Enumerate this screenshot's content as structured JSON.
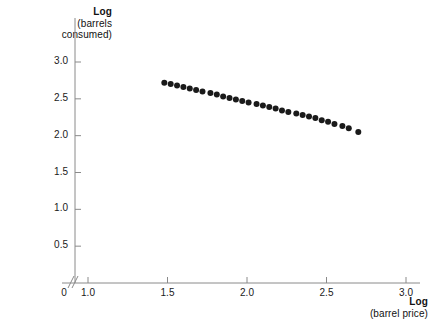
{
  "figure": {
    "background": "#ffffff",
    "ink_color": "#1a1a1a",
    "point_color": "#1a1a1a",
    "axis_color": "#8a8a8a"
  },
  "axes": {
    "y_title_main": "Log",
    "y_title_sub": "(barrels consumed)",
    "y_title_line1": "Log",
    "y_title_line2": "(barrels",
    "y_title_line3": "consumed)",
    "x_title_main": "Log",
    "x_title_sub": "(barrel price)",
    "origin_label": "0",
    "break_symbol": "//"
  },
  "chart_data": {
    "type": "scatter",
    "title": "",
    "xlabel": "Log (barrel price)",
    "ylabel": "Log (barrels consumed)",
    "xlim": [
      1.0,
      3.0
    ],
    "ylim": [
      0.0,
      3.0
    ],
    "xticks": [
      1.0,
      1.5,
      2.0,
      2.5,
      3.0
    ],
    "xtick_labels": [
      "1.0",
      "1.5",
      "2.0",
      "2.5",
      "3.0"
    ],
    "yticks": [
      0.5,
      1.0,
      1.5,
      2.0,
      2.5,
      3.0
    ],
    "ytick_labels": [
      "0.5",
      "1.0",
      "1.5",
      "2.0",
      "2.5",
      "3.0"
    ],
    "grid": false,
    "legend": false,
    "axis_break": {
      "axis": "x",
      "after_value": 0,
      "before_value": 1.0
    },
    "marker": {
      "shape": "circle",
      "size_px": 6,
      "color": "#1a1a1a"
    },
    "n_points": 30,
    "x": [
      1.48,
      1.52,
      1.56,
      1.6,
      1.64,
      1.68,
      1.72,
      1.77,
      1.81,
      1.85,
      1.89,
      1.93,
      1.97,
      2.01,
      2.06,
      2.1,
      2.14,
      2.18,
      2.22,
      2.26,
      2.31,
      2.35,
      2.39,
      2.43,
      2.47,
      2.51,
      2.55,
      2.6,
      2.64,
      2.7
    ],
    "y": [
      2.72,
      2.7,
      2.68,
      2.66,
      2.64,
      2.62,
      2.6,
      2.58,
      2.56,
      2.53,
      2.51,
      2.49,
      2.47,
      2.45,
      2.43,
      2.41,
      2.39,
      2.37,
      2.34,
      2.32,
      2.3,
      2.28,
      2.26,
      2.24,
      2.21,
      2.19,
      2.16,
      2.13,
      2.1,
      2.05
    ],
    "trend": "decreasing linear"
  }
}
